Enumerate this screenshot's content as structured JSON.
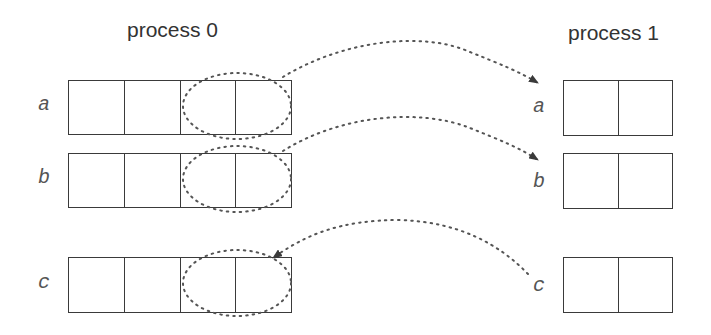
{
  "process0": {
    "title": "process 0",
    "arrays": [
      {
        "label": "a",
        "cells": 4
      },
      {
        "label": "b",
        "cells": 4
      },
      {
        "label": "c",
        "cells": 4
      }
    ]
  },
  "process1": {
    "title": "process 1",
    "arrays": [
      {
        "label": "a",
        "cells": 2
      },
      {
        "label": "b",
        "cells": 2
      },
      {
        "label": "c",
        "cells": 2
      }
    ]
  },
  "arrows": [
    {
      "from": "process 0 a (last 2 cells)",
      "to": "process 1 a",
      "style": "dotted"
    },
    {
      "from": "process 0 b (last 2 cells)",
      "to": "process 1 b",
      "style": "dotted"
    },
    {
      "from": "process 1 c",
      "to": "process 0 c (last 2 cells)",
      "style": "dotted"
    }
  ],
  "colors": {
    "line": "#3a3a3a",
    "text": "#333333"
  }
}
